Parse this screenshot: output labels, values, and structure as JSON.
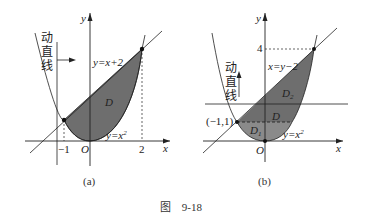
{
  "figure_caption": {
    "prefix": "图",
    "number": "9-18"
  },
  "panel_a": {
    "caption": "(a)",
    "axis_x": "x",
    "axis_y": "y",
    "origin": "O",
    "ticks": {
      "neg1": "−1",
      "pos2": "2"
    },
    "line_label": "y=x+2",
    "curve_label": "y=x",
    "curve_exp": "2",
    "region_label": "D",
    "moving_line_label": [
      "动",
      "直",
      "线"
    ]
  },
  "panel_b": {
    "caption": "(b)",
    "axis_x": "x",
    "axis_y": "y",
    "origin": "O",
    "tick_4": "4",
    "point_label": "(−1,1)",
    "line_label": "x=y−2",
    "curve_label": "y=x",
    "curve_exp": "2",
    "region_D": "D",
    "region_D1": "D",
    "region_D1_sub": "1",
    "region_D2": "D",
    "region_D2_sub": "2",
    "moving_line_label": [
      "动",
      "直",
      "线"
    ]
  },
  "colors": {
    "fill_dark": "#6e6e6e",
    "fill_light": "#9a9a9a",
    "stroke": "#222222"
  }
}
